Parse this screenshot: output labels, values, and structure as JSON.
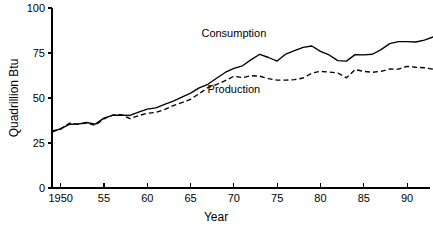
{
  "chart_data": {
    "type": "line",
    "title": "",
    "xlabel": "Year",
    "ylabel": "Quadrillion Btu",
    "xlim": [
      1949,
      1993
    ],
    "ylim": [
      0,
      100
    ],
    "grid": false,
    "legend_position": "inline-annotation",
    "x": [
      1949,
      1950,
      1951,
      1952,
      1953,
      1954,
      1955,
      1956,
      1957,
      1958,
      1959,
      1960,
      1961,
      1962,
      1963,
      1964,
      1965,
      1966,
      1967,
      1968,
      1969,
      1970,
      1971,
      1972,
      1973,
      1974,
      1975,
      1976,
      1977,
      1978,
      1979,
      1980,
      1981,
      1982,
      1983,
      1984,
      1985,
      1986,
      1987,
      1988,
      1989,
      1990,
      1991,
      1992,
      1993
    ],
    "xticks": [
      1950,
      1955,
      1960,
      1965,
      1970,
      1975,
      1980,
      1985,
      1990
    ],
    "xtick_labels": [
      "1950",
      "55",
      "60",
      "65",
      "70",
      "75",
      "80",
      "85",
      "90"
    ],
    "yticks": [
      0,
      25,
      50,
      75,
      100
    ],
    "ytick_labels": [
      "0",
      "25",
      "50",
      "75",
      "100"
    ],
    "series": [
      {
        "name": "Consumption",
        "style": "solid",
        "label_x": 1970,
        "label_y": 84,
        "values": [
          31.0,
          33.0,
          35.4,
          35.5,
          36.4,
          35.5,
          38.8,
          40.4,
          40.5,
          40.3,
          42.1,
          43.8,
          44.5,
          46.5,
          48.3,
          50.5,
          52.7,
          55.6,
          57.6,
          61.0,
          64.2,
          66.4,
          67.9,
          71.3,
          74.3,
          72.5,
          70.5,
          74.4,
          76.3,
          78.1,
          78.9,
          75.9,
          73.9,
          70.8,
          70.5,
          74.1,
          74.0,
          74.3,
          76.9,
          80.2,
          81.3,
          81.3,
          81.1,
          82.2,
          83.9
        ]
      },
      {
        "name": "Production",
        "style": "dashed",
        "label_x": 1970,
        "label_y": 53,
        "values": [
          31.7,
          32.6,
          36.0,
          35.5,
          36.1,
          34.8,
          38.4,
          40.5,
          40.8,
          38.5,
          40.2,
          41.5,
          42.0,
          43.6,
          45.8,
          47.4,
          49.3,
          52.4,
          55.8,
          57.5,
          59.6,
          62.1,
          61.3,
          62.4,
          62.1,
          60.8,
          59.9,
          59.9,
          60.2,
          61.1,
          63.8,
          64.8,
          64.4,
          63.9,
          61.2,
          65.8,
          64.8,
          64.3,
          64.8,
          66.1,
          66.0,
          67.6,
          67.1,
          66.8,
          66.0
        ]
      }
    ]
  },
  "axis": {
    "ylabel": "Quadrillion Btu",
    "xlabel": "Year"
  }
}
